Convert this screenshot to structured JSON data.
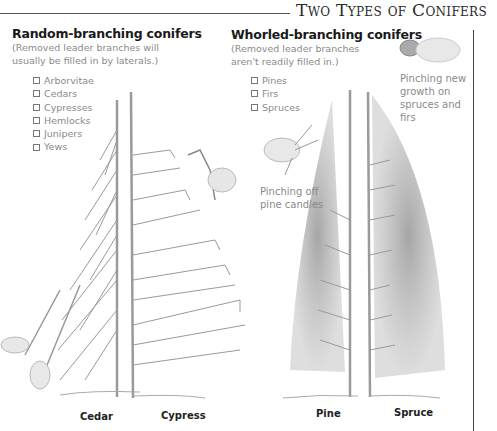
{
  "page": {
    "title": "Two Types of Conifers"
  },
  "random_branching": {
    "title": "Random-branching conifers",
    "description": "(Removed leader branches will usually be filled in by laterals.)",
    "items": [
      "Arborvitae",
      "Cedars",
      "Cypresses",
      "Hemlocks",
      "Junipers",
      "Yews"
    ]
  },
  "whorled_branching": {
    "title": "Whorled-branching conifers",
    "description": "(Removed leader branches aren't readily filled in.)",
    "items": [
      "Pines",
      "Firs",
      "Spruces"
    ]
  },
  "captions": {
    "pinching_candles": "Pinching off pine candles",
    "pinching_growth": "Pinching new growth on spruces and firs"
  },
  "tree_labels": {
    "cedar": "Cedar",
    "cypress": "Cypress",
    "pine": "Pine",
    "spruce": "Spruce"
  },
  "colors": {
    "rule": "#555555",
    "text_heading": "#1a1a1a",
    "text_muted": "#8a8a8a",
    "illustration": "#9a9a9a"
  }
}
